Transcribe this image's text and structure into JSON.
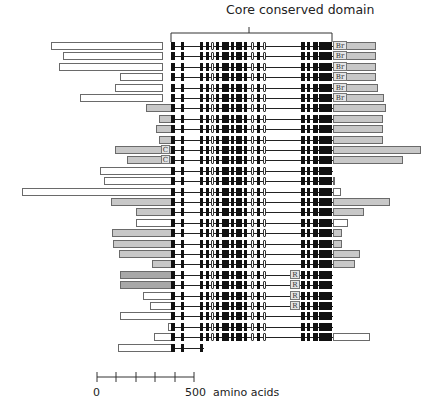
{
  "title": "Core conserved domain",
  "scale": {
    "start_label": "0",
    "end_label": "500",
    "unit_label": "amino acids",
    "ticks": 6
  },
  "colors": {
    "exon": "#111111",
    "open_exon": "#ffffff",
    "gray_extension": "#c8c8c8",
    "dark_gray_extension": "#a8a8a8",
    "white_extension": "#ffffff"
  },
  "domain_labels": {
    "br": "Br",
    "c": "C",
    "r": "R"
  },
  "rows": [
    {
      "left": [
        51,
        163,
        "w"
      ],
      "right": [
        333,
        376,
        "g"
      ],
      "tag": "Br"
    },
    {
      "left": [
        63,
        163,
        "w"
      ],
      "right": [
        333,
        376,
        "g"
      ],
      "tag": "Br"
    },
    {
      "left": [
        59,
        163,
        "w"
      ],
      "right": [
        333,
        376,
        "g"
      ],
      "tag": "Br"
    },
    {
      "left": [
        120,
        163,
        "w"
      ],
      "right": [
        333,
        376,
        "g"
      ],
      "tag": "Br"
    },
    {
      "left": [
        115,
        163,
        "w"
      ],
      "right": [
        333,
        378,
        "g"
      ],
      "tag": "Br"
    },
    {
      "left": [
        80,
        163,
        "w"
      ],
      "right": [
        333,
        384,
        "g"
      ],
      "tag": "Br"
    },
    {
      "left": [
        146,
        172,
        "g"
      ],
      "right": [
        333,
        386,
        "g"
      ]
    },
    {
      "left": [
        159,
        172,
        "g"
      ],
      "right": [
        333,
        383,
        "g"
      ]
    },
    {
      "left": [
        156,
        172,
        "g"
      ],
      "right": [
        333,
        383,
        "g"
      ]
    },
    {
      "left": [
        159,
        172,
        "g"
      ],
      "right": [
        333,
        383,
        "g"
      ]
    },
    {
      "left": [
        115,
        172,
        "g"
      ],
      "right": [
        333,
        421,
        "g"
      ],
      "tag": "C"
    },
    {
      "left": [
        127,
        172,
        "g"
      ],
      "right": [
        333,
        403,
        "g"
      ],
      "tag": "C"
    },
    {
      "left": [
        100,
        172,
        "w"
      ],
      "right": [
        333,
        333,
        "w"
      ]
    },
    {
      "left": [
        104,
        172,
        "w"
      ],
      "right": [
        333,
        334,
        "w"
      ]
    },
    {
      "left": [
        22,
        172,
        "w"
      ],
      "right": [
        333,
        341,
        "w"
      ]
    },
    {
      "left": [
        111,
        172,
        "g"
      ],
      "right": [
        333,
        390,
        "g"
      ]
    },
    {
      "left": [
        136,
        172,
        "g"
      ],
      "right": [
        333,
        364,
        "g"
      ]
    },
    {
      "left": [
        136,
        172,
        "w"
      ],
      "right": [
        333,
        348,
        "w"
      ]
    },
    {
      "left": [
        112,
        172,
        "g"
      ],
      "right": [
        333,
        342,
        "g"
      ]
    },
    {
      "left": [
        113,
        172,
        "g"
      ],
      "right": [
        333,
        342,
        "g"
      ]
    },
    {
      "left": [
        119,
        172,
        "g"
      ],
      "right": [
        333,
        360,
        "g"
      ]
    },
    {
      "left": [
        152,
        172,
        "g"
      ],
      "right": [
        333,
        355,
        "g"
      ]
    },
    {
      "left": [
        120,
        172,
        "d"
      ],
      "right": [
        333,
        333,
        "w"
      ],
      "tag": "R"
    },
    {
      "left": [
        120,
        172,
        "d"
      ],
      "right": [
        333,
        333,
        "w"
      ],
      "tag": "R"
    },
    {
      "left": [
        143,
        172,
        "w"
      ],
      "right": [
        333,
        333,
        "w"
      ],
      "tag": "R"
    },
    {
      "left": [
        150,
        172,
        "w"
      ],
      "right": [
        333,
        333,
        "w"
      ],
      "tag": "R"
    },
    {
      "left": [
        120,
        172,
        "w"
      ],
      "right": [
        333,
        333,
        "w"
      ]
    },
    {
      "left": [
        168,
        172,
        "w"
      ],
      "right": [
        333,
        333,
        "w"
      ]
    },
    {
      "left": [
        154,
        172,
        "w"
      ],
      "right": [
        333,
        370,
        "w"
      ]
    },
    {
      "left": [
        118,
        172,
        "w"
      ],
      "right": [
        0,
        0,
        "w"
      ],
      "truncated": true
    }
  ]
}
